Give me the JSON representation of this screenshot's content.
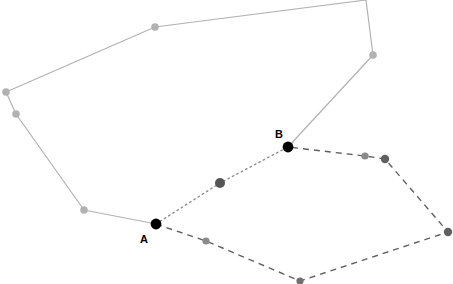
{
  "canvas": {
    "width": 453,
    "height": 284,
    "background": "#ffffff"
  },
  "colors": {
    "path_light_gray": "#b2b2b2",
    "path_dark_gray": "#606060",
    "path_dotted_gray": "#8c8c8c",
    "node_light_gray": "#b2b2b2",
    "node_mid_gray": "#8a8a8a",
    "node_dark_gray": "#555555",
    "node_black": "#000000",
    "label_text": "#000000"
  },
  "paths": [
    {
      "id": "light-gray-open-path",
      "name": "light-gray-solid-path",
      "style": "solid",
      "stroke": "#b2b2b2",
      "stroke_width": 1.2,
      "points": [
        [
          156,
          224
        ],
        [
          84,
          210
        ],
        [
          16,
          114
        ],
        [
          6,
          92
        ],
        [
          155,
          27
        ],
        [
          366,
          0
        ],
        [
          373,
          55
        ],
        [
          288,
          147
        ]
      ]
    },
    {
      "id": "dark-gray-dashed-path",
      "name": "dark-gray-dashed-path",
      "style": "dashed",
      "stroke": "#606060",
      "stroke_width": 1.4,
      "dash": "6 5",
      "points": [
        [
          156,
          224
        ],
        [
          206,
          241
        ],
        [
          300,
          281
        ],
        [
          448,
          232
        ],
        [
          385,
          159
        ],
        [
          365,
          156
        ],
        [
          288,
          147
        ]
      ]
    },
    {
      "id": "gray-dotted-path",
      "name": "gray-dotted-path",
      "style": "dotted",
      "stroke": "#8c8c8c",
      "stroke_width": 1.4,
      "dash": "1.5 3.5",
      "points": [
        [
          156,
          224
        ],
        [
          220,
          183
        ],
        [
          288,
          147
        ]
      ]
    }
  ],
  "nodes": [
    {
      "id": "n-a",
      "name": "node-a",
      "x": 156,
      "y": 224,
      "r": 5.4,
      "fill": "#000000"
    },
    {
      "id": "n-b",
      "name": "node-b",
      "x": 288,
      "y": 147,
      "r": 5.4,
      "fill": "#000000"
    },
    {
      "id": "n-m1",
      "name": "node-dotted-mid",
      "x": 220,
      "y": 183,
      "r": 5.0,
      "fill": "#555555"
    },
    {
      "id": "n-l1",
      "name": "node-light-lower",
      "x": 84,
      "y": 210,
      "r": 3.8,
      "fill": "#b2b2b2"
    },
    {
      "id": "n-l2",
      "name": "node-light-leftlow",
      "x": 16,
      "y": 114,
      "r": 3.8,
      "fill": "#b2b2b2"
    },
    {
      "id": "n-l3",
      "name": "node-light-leftup",
      "x": 6,
      "y": 92,
      "r": 3.8,
      "fill": "#b2b2b2"
    },
    {
      "id": "n-l4",
      "name": "node-light-top",
      "x": 155,
      "y": 27,
      "r": 3.8,
      "fill": "#b2b2b2"
    },
    {
      "id": "n-l5",
      "name": "node-light-right",
      "x": 373,
      "y": 55,
      "r": 3.8,
      "fill": "#b2b2b2"
    },
    {
      "id": "n-d1",
      "name": "node-dash-lowleft",
      "x": 206,
      "y": 241,
      "r": 3.6,
      "fill": "#8a8a8a"
    },
    {
      "id": "n-d2",
      "name": "node-dash-bottom",
      "x": 300,
      "y": 281,
      "r": 3.6,
      "fill": "#707070"
    },
    {
      "id": "n-d3",
      "name": "node-dash-right",
      "x": 448,
      "y": 232,
      "r": 4.2,
      "fill": "#606060"
    },
    {
      "id": "n-d4",
      "name": "node-dash-upperright",
      "x": 385,
      "y": 159,
      "r": 4.2,
      "fill": "#606060"
    },
    {
      "id": "n-d5",
      "name": "node-dash-upper",
      "x": 365,
      "y": 156,
      "r": 3.6,
      "fill": "#8a8a8a"
    }
  ],
  "labels": [
    {
      "id": "lbl-a",
      "name": "label-a",
      "text": "A",
      "x": 144,
      "y": 243,
      "anchor": "middle"
    },
    {
      "id": "lbl-b",
      "name": "label-b",
      "text": "B",
      "x": 279,
      "y": 138,
      "anchor": "middle"
    }
  ]
}
